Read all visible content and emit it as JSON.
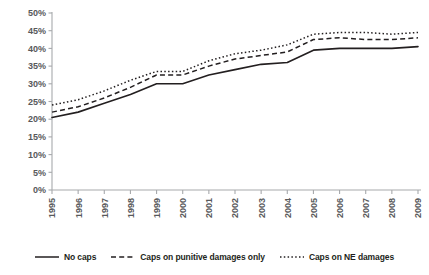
{
  "chart_data": {
    "type": "line",
    "title": "",
    "subtitle": "",
    "xlabel": "",
    "ylabel": "",
    "grid": false,
    "legend_position": "bottom",
    "ylim": [
      0,
      50
    ],
    "yticks": [
      "0%",
      "5%",
      "10%",
      "15%",
      "20%",
      "25%",
      "30%",
      "35%",
      "40%",
      "45%",
      "50%"
    ],
    "ytick_values": [
      0,
      5,
      10,
      15,
      20,
      25,
      30,
      35,
      40,
      45,
      50
    ],
    "categories": [
      "1995",
      "1996",
      "1997",
      "1998",
      "1999",
      "2000",
      "2001",
      "2002",
      "2003",
      "2004",
      "2005",
      "2006",
      "2007",
      "2008",
      "2009"
    ],
    "x": [
      1995,
      1996,
      1997,
      1998,
      1999,
      2000,
      2001,
      2002,
      2003,
      2004,
      2005,
      2006,
      2007,
      2008,
      2009
    ],
    "series": [
      {
        "name": "No caps",
        "style": "solid",
        "color": "#231f20",
        "values": [
          20.5,
          22.0,
          24.5,
          27.0,
          30.0,
          30.0,
          32.5,
          34.0,
          35.5,
          36.0,
          39.5,
          40.0,
          40.0,
          40.0,
          40.5
        ]
      },
      {
        "name": "Caps on punitive damages only",
        "style": "dashed",
        "color": "#231f20",
        "values": [
          22.0,
          23.5,
          26.0,
          29.0,
          32.5,
          32.5,
          35.0,
          37.0,
          38.0,
          39.0,
          42.5,
          43.0,
          42.5,
          42.5,
          43.0
        ]
      },
      {
        "name": "Caps on NE damages",
        "style": "dotted",
        "color": "#231f20",
        "values": [
          24.0,
          25.5,
          28.0,
          31.0,
          33.5,
          33.5,
          36.5,
          38.5,
          39.5,
          41.0,
          44.0,
          44.5,
          44.5,
          44.0,
          44.5
        ]
      }
    ]
  },
  "legend": {
    "items": [
      {
        "label": "No caps",
        "style": "solid"
      },
      {
        "label": "Caps on punitive damages only",
        "style": "dashed"
      },
      {
        "label": "Caps on NE damages",
        "style": "dotted"
      }
    ]
  },
  "colors": {
    "ink": "#231f20",
    "axis": "#a7a9ac",
    "tick_label": "#58595b",
    "background": "#ffffff"
  }
}
